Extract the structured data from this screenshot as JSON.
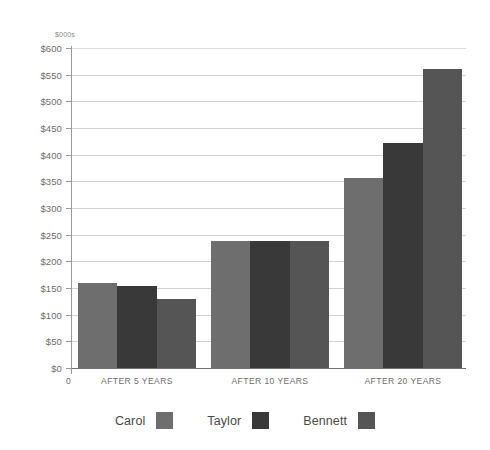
{
  "chart_data": {
    "type": "bar",
    "title": "",
    "subtitle": "",
    "unit_label": "$000s",
    "xlabel": "",
    "ylabel": "",
    "origin_label": "0",
    "categories": [
      "AFTER 5 YEARS",
      "AFTER 10 YEARS",
      "AFTER 20 YEARS"
    ],
    "series": [
      {
        "name": "Carol",
        "color": "#6e6e6e",
        "values": [
          160,
          238,
          357
        ]
      },
      {
        "name": "Taylor",
        "color": "#393939",
        "values": [
          153,
          238,
          422
        ]
      },
      {
        "name": "Bennett",
        "color": "#555555",
        "values": [
          130,
          238,
          560
        ]
      }
    ],
    "ylim": [
      0,
      600
    ],
    "ytick_step": 50,
    "ytick_labels": [
      "$600",
      "$550",
      "$500",
      "$450",
      "$400",
      "$350",
      "$300",
      "$250",
      "$200",
      "$150",
      "$100",
      "$50",
      "$0"
    ],
    "ytick_values": [
      600,
      550,
      500,
      450,
      400,
      350,
      300,
      250,
      200,
      150,
      100,
      50,
      0
    ],
    "grid": true,
    "legend_position": "bottom",
    "background_color": "#ffffff",
    "grid_color": "#d2d2d2",
    "axis_color": "#9a9a9a",
    "text_color": "#6d6d6d"
  }
}
